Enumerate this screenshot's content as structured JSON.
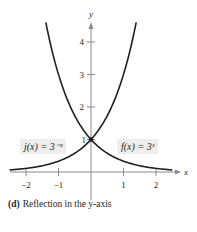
{
  "figure": {
    "caption_letter": "(d)",
    "caption_text": "Reflection in the y-axis",
    "label_left": "j(x) = 3⁻ˣ",
    "label_right": "f(x) = 3ˣ"
  },
  "chart_data": {
    "type": "line",
    "title": "",
    "xlabel": "x",
    "ylabel": "y",
    "xlim": [
      -2.5,
      2.55
    ],
    "ylim": [
      0,
      4.6
    ],
    "x_ticks": [
      -2,
      -1,
      1,
      2
    ],
    "x_tick_labels": [
      "−2",
      "−1",
      "1",
      "2"
    ],
    "y_ticks": [
      1,
      2,
      3,
      4
    ],
    "y_tick_labels": [
      "1",
      "2",
      "3",
      "4"
    ],
    "grid": false,
    "series": [
      {
        "name": "f(x) = 3^x",
        "formula": "3^x",
        "x": [
          -2.5,
          -2,
          -1.5,
          -1,
          -0.5,
          0,
          0.5,
          1,
          1.39
        ],
        "values": [
          0.06,
          0.11,
          0.19,
          0.33,
          0.58,
          1,
          1.73,
          3,
          4.6
        ]
      },
      {
        "name": "j(x) = 3^-x",
        "formula": "3^-x",
        "x": [
          -1.39,
          -1,
          -0.5,
          0,
          0.5,
          1,
          1.5,
          2,
          2.5
        ],
        "values": [
          4.6,
          3,
          1.73,
          1,
          0.58,
          0.33,
          0.19,
          0.11,
          0.06
        ]
      }
    ],
    "annotations": [
      {
        "text": "j(x) = 3^-x",
        "position": "left of y-axis, y≈1.6"
      },
      {
        "text": "f(x) = 3^x",
        "position": "right of y-axis, y≈1.6"
      },
      {
        "text": "intersection point (0, 1)"
      }
    ],
    "legend": "none (inline labels)"
  }
}
